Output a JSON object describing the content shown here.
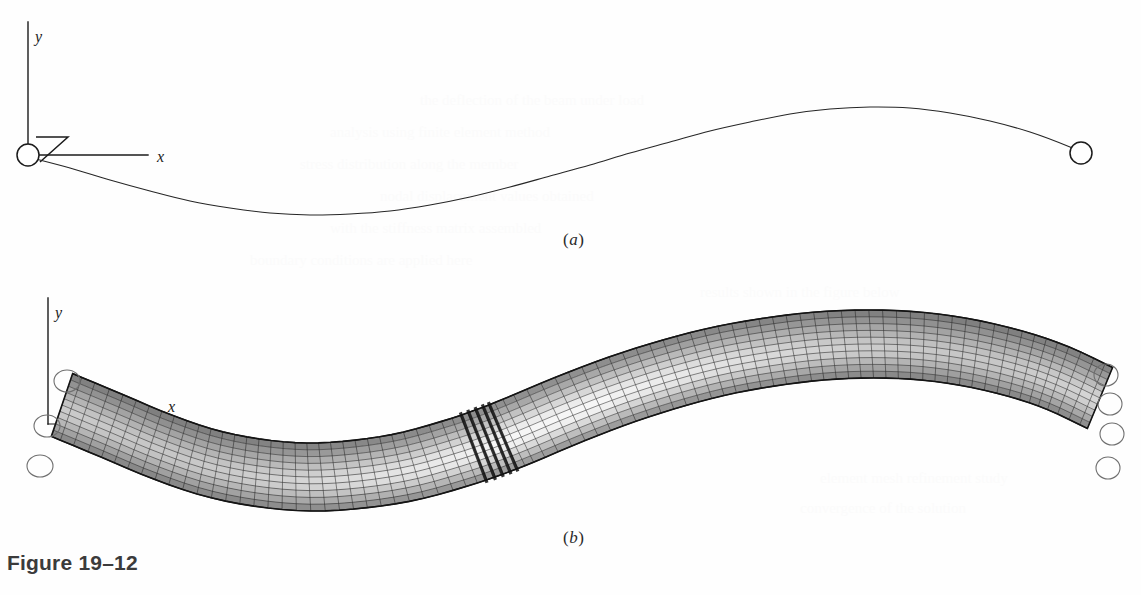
{
  "figure": {
    "caption": "Figure 19–12",
    "panels": [
      {
        "id": "a",
        "label": "(a)",
        "label_x": 563,
        "label_y": 230,
        "description": "centerline deflection curve of beam with pinned ends"
      },
      {
        "id": "b",
        "label": "(b)",
        "label_x": 563,
        "label_y": 528,
        "description": "deformed finite element mesh of beam"
      }
    ]
  },
  "panel_a": {
    "axes": {
      "origin": {
        "x": 28,
        "y": 155
      },
      "y_axis": {
        "x": 28,
        "y_top": 22,
        "y_bottom": 155,
        "label": "y",
        "label_x": 35,
        "label_y": 28
      },
      "x_axis": {
        "y": 155,
        "x_start": 28,
        "x_end": 148,
        "label": "x",
        "label_x": 157,
        "label_y": 148
      }
    },
    "support_left": {
      "cx": 28,
      "cy": 155,
      "r": 11,
      "type": "pin-support-circle"
    },
    "support_right": {
      "cx": 1081,
      "cy": 153,
      "r": 11,
      "type": "pin-support-circle"
    },
    "z_marker": {
      "points": "36,137 68,137 40,162",
      "type": "z-angle-indicator"
    },
    "deflection_curve": {
      "stroke": "#262626",
      "stroke_width": 1.1,
      "points": [
        [
          28,
          157
        ],
        [
          70,
          168
        ],
        [
          110,
          180
        ],
        [
          150,
          191
        ],
        [
          190,
          201
        ],
        [
          230,
          208
        ],
        [
          270,
          213
        ],
        [
          310,
          215
        ],
        [
          350,
          214
        ],
        [
          390,
          211
        ],
        [
          430,
          205
        ],
        [
          470,
          197
        ],
        [
          510,
          187
        ],
        [
          550,
          176
        ],
        [
          590,
          165
        ],
        [
          630,
          153
        ],
        [
          670,
          142
        ],
        [
          710,
          131
        ],
        [
          750,
          122
        ],
        [
          790,
          114
        ],
        [
          830,
          109
        ],
        [
          870,
          107
        ],
        [
          910,
          108
        ],
        [
          950,
          113
        ],
        [
          990,
          121
        ],
        [
          1030,
          132
        ],
        [
          1070,
          147
        ],
        [
          1081,
          153
        ]
      ]
    }
  },
  "panel_b": {
    "axes": {
      "origin": {
        "x": 48,
        "y": 424
      },
      "y_axis": {
        "x": 48,
        "y_top": 298,
        "y_bottom": 424,
        "label": "y",
        "label_x": 55,
        "label_y": 304
      },
      "x_axis": {
        "y": 424,
        "x_start": 48,
        "x_end": 132,
        "label": "x",
        "label_x": 168,
        "label_y": 398
      }
    },
    "supports_left": [
      {
        "cx": 67,
        "cy": 381,
        "rx": 13,
        "ry": 11
      },
      {
        "cx": 47,
        "cy": 426,
        "rx": 13,
        "ry": 11
      },
      {
        "cx": 40,
        "cy": 466,
        "rx": 13,
        "ry": 11
      }
    ],
    "supports_right": [
      {
        "cx": 1106,
        "cy": 375,
        "rx": 12,
        "ry": 11
      },
      {
        "cx": 1110,
        "cy": 404,
        "rx": 12,
        "ry": 11
      },
      {
        "cx": 1112,
        "cy": 434,
        "rx": 12,
        "ry": 11
      },
      {
        "cx": 1108,
        "cy": 468,
        "rx": 12,
        "ry": 11
      }
    ],
    "mesh": {
      "type": "quad-shell-mesh",
      "columns": 84,
      "rows": 10,
      "line_color": "#1c1c1c",
      "line_width": 0.55,
      "shading": "grayscale-contour",
      "shade_light": "#f2f2f2",
      "shade_mid": "#c9c9c9",
      "shade_dark": "#8c8c8c",
      "joint_seam_x": 492,
      "joint_color": "#111111",
      "centerline": [
        [
          62,
          405
        ],
        [
          110,
          425
        ],
        [
          160,
          446
        ],
        [
          210,
          463
        ],
        [
          260,
          473
        ],
        [
          310,
          477
        ],
        [
          360,
          474
        ],
        [
          410,
          466
        ],
        [
          460,
          452
        ],
        [
          492,
          441
        ],
        [
          520,
          430
        ],
        [
          570,
          409
        ],
        [
          620,
          390
        ],
        [
          670,
          374
        ],
        [
          720,
          361
        ],
        [
          770,
          352
        ],
        [
          820,
          346
        ],
        [
          870,
          344
        ],
        [
          920,
          346
        ],
        [
          970,
          353
        ],
        [
          1020,
          365
        ],
        [
          1060,
          379
        ],
        [
          1100,
          398
        ]
      ],
      "half_thickness": 34
    }
  },
  "colors": {
    "background": "#fefefe",
    "ink": "#1b1b1b",
    "caption": "#3b3b3b",
    "mesh_line": "#1c1c1c"
  },
  "ghost_text": [
    {
      "x": 420,
      "y": 92,
      "text": "the deflection of the beam under load"
    },
    {
      "x": 330,
      "y": 124,
      "text": "analysis using finite element method"
    },
    {
      "x": 300,
      "y": 156,
      "text": "stress distribution along the member"
    },
    {
      "x": 380,
      "y": 188,
      "text": "nodal displacement values obtained"
    },
    {
      "x": 330,
      "y": 220,
      "text": "with the stiffness matrix assembled"
    },
    {
      "x": 250,
      "y": 252,
      "text": "boundary conditions are applied here"
    },
    {
      "x": 700,
      "y": 284,
      "text": "results shown in the figure below"
    },
    {
      "x": 760,
      "y": 316,
      "text": "for the given loading condition"
    },
    {
      "x": 820,
      "y": 470,
      "text": "element mesh refinement study"
    },
    {
      "x": 800,
      "y": 500,
      "text": "convergence of the solution"
    }
  ]
}
